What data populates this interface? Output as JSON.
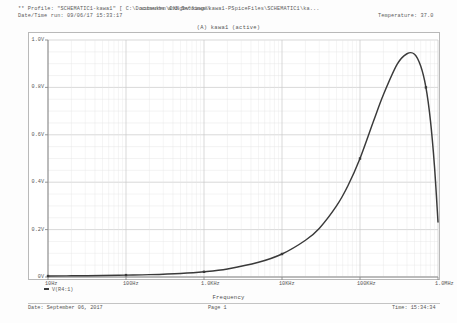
{
  "header": {
    "profile_line": "** Profile: \"SCHEMATIC1-kawa1\"  [ C:\\Documents and Settings\\",
    "path_line": "sotsuken\\IXNgbv\\kawa\\kawa1-PSpiceFiles\\SCHEMATIC1\\ka...",
    "date_time_run": "Date/Time run: 09/06/17 15:33:17",
    "temperature": "Temperature: 37.0"
  },
  "plot": {
    "title": "(A) kawa1 (active)",
    "legend_label": "V(R4:1)",
    "trace_color": "#3a3a3a",
    "grid_color": "#c9c9c9",
    "minor_grid_color": "#e6e6e6",
    "axis_color": "#8a8a8a"
  },
  "footer": {
    "date": "Date: September 06, 2017",
    "page": "Page 1",
    "time": "Time: 15:34:34"
  },
  "chart_data": {
    "type": "line",
    "title": "(A) kawa1 (active)",
    "xlabel": "Frequency",
    "ylabel": "",
    "xscale": "log",
    "xlim": [
      10,
      1000000
    ],
    "ylim": [
      0,
      1.0
    ],
    "grid": true,
    "legend_position": "bottom-left",
    "xticks": [
      10,
      100,
      1000,
      10000,
      100000,
      1000000
    ],
    "xtick_labels": [
      "10Hz",
      "100Hz",
      "1.0KHz",
      "10KHz",
      "100KHz",
      "1.0MHz"
    ],
    "yticks": [
      0,
      0.2,
      0.4,
      0.6,
      0.8,
      1.0
    ],
    "ytick_labels": [
      "0V",
      "0.2V",
      "0.4V",
      "0.6V",
      "0.8V",
      "1.0V"
    ],
    "series": [
      {
        "name": "V(R4:1)",
        "color": "#3a3a3a",
        "x": [
          10,
          20,
          50,
          100,
          200,
          500,
          1000,
          2000,
          5000,
          10000,
          20000,
          30000,
          50000,
          70000,
          100000,
          150000,
          200000,
          300000,
          400000,
          500000,
          600000,
          700000,
          800000,
          900000,
          1000000
        ],
        "y": [
          0.004,
          0.005,
          0.006,
          0.008,
          0.01,
          0.015,
          0.022,
          0.034,
          0.062,
          0.097,
          0.155,
          0.205,
          0.3,
          0.385,
          0.5,
          0.66,
          0.77,
          0.898,
          0.942,
          0.94,
          0.89,
          0.8,
          0.66,
          0.47,
          0.232
        ]
      }
    ]
  }
}
